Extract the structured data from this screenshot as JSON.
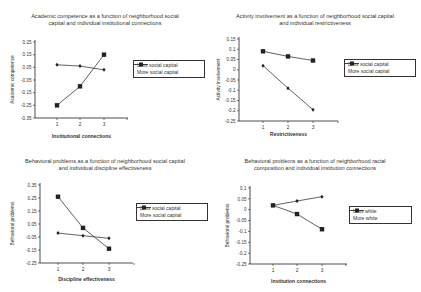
{
  "chart_data": [
    {
      "type": "line",
      "title": "Academic competence as a function of neighborhood social capital and individual institutional connections",
      "title_lines": [
        "Academic competence as a function of neighborhood social",
        "capital and individual institutional connections"
      ],
      "xlabel": "Institutional connections",
      "ylabel": "Academic competence",
      "x": [
        1,
        2,
        3
      ],
      "ylim": [
        -0.35,
        0.25
      ],
      "yticks": [
        0.25,
        0.15,
        0.05,
        -0.05,
        -0.15,
        -0.25,
        -0.35
      ],
      "ytick_labels": [
        "0.25",
        "0.15",
        "0.05",
        "-0.05",
        "-0.15",
        "-0.25",
        "-0.35"
      ],
      "series": [
        {
          "name": "Less social capital",
          "marker": "diamond",
          "values": [
            0.07,
            0.06,
            0.03
          ]
        },
        {
          "name": "More social capital",
          "marker": "square",
          "values": [
            -0.25,
            -0.1,
            0.15
          ]
        }
      ],
      "legend_position": "right",
      "grid": false
    },
    {
      "type": "line",
      "title": "Activity involvement as a function of neighborhood social capital and individual restrictiveness",
      "title_lines": [
        "Activity involvement as a function of neighborhood social capital",
        "and individual restrictiveness"
      ],
      "xlabel": "Restrictiveness",
      "ylabel": "Activity involvement",
      "x": [
        1,
        2,
        3
      ],
      "ylim": [
        -0.25,
        0.15
      ],
      "yticks": [
        0.15,
        0.1,
        0.05,
        0,
        -0.05,
        -0.1,
        -0.15,
        -0.2,
        -0.25
      ],
      "ytick_labels": [
        "0.15",
        "0.1",
        "0.05",
        "0",
        "-0.05",
        "-0.1",
        "-0.15",
        "-0.2",
        "-0.25"
      ],
      "series": [
        {
          "name": "Less social capital",
          "marker": "diamond",
          "values": [
            0.02,
            -0.09,
            -0.195
          ]
        },
        {
          "name": "More social capital",
          "marker": "square",
          "values": [
            0.09,
            0.065,
            0.045
          ]
        }
      ],
      "legend_position": "right",
      "grid": false
    },
    {
      "type": "line",
      "title": "Behavioral problems as a function of neighborhood social capital and individual discipline effectiveness",
      "title_lines": [
        "Behavioral problems as a function of neighborhood social capital",
        "and individual discipline effectiveness"
      ],
      "xlabel": "Discipline effectiveness",
      "ylabel": "Behavioral problems",
      "x": [
        1,
        2,
        3
      ],
      "ylim": [
        -0.25,
        0.35
      ],
      "yticks": [
        0.35,
        0.25,
        0.15,
        0.05,
        -0.05,
        -0.15,
        -0.25
      ],
      "ytick_labels": [
        "0.35",
        "0.25",
        "0.15",
        "0.05",
        "-0.05",
        "-0.15",
        "-0.25"
      ],
      "series": [
        {
          "name": "Less social capital",
          "marker": "diamond",
          "values": [
            -0.02,
            -0.04,
            -0.06
          ]
        },
        {
          "name": "More social capital",
          "marker": "square",
          "values": [
            0.26,
            0.02,
            -0.14
          ]
        }
      ],
      "legend_position": "right",
      "grid": false
    },
    {
      "type": "line",
      "title": "Behavioral problems as a function of neighborhood racial composition and individual institution connections",
      "title_lines": [
        "Behavioral problems as a function of neighborhood racial",
        "composition and individual institution connections"
      ],
      "xlabel": "Institution connections",
      "ylabel": "Behavioral problems",
      "x": [
        1,
        2,
        3
      ],
      "ylim": [
        -0.25,
        0.1
      ],
      "yticks": [
        0.1,
        0.05,
        0,
        -0.05,
        -0.1,
        -0.15,
        -0.2,
        -0.25
      ],
      "ytick_labels": [
        "0.1",
        "0.05",
        "0",
        "-0.05",
        "-0.1",
        "-0.15",
        "-0.2",
        "-0.25"
      ],
      "series": [
        {
          "name": "Less white",
          "marker": "diamond",
          "values": [
            0.02,
            0.04,
            0.06
          ]
        },
        {
          "name": "More white",
          "marker": "square",
          "values": [
            0.02,
            -0.02,
            -0.09
          ]
        }
      ],
      "legend_position": "right",
      "grid": false
    }
  ],
  "layout": {
    "panels": [
      {
        "left": 0,
        "top": 0,
        "title_top": 13,
        "plot": {
          "x0": 35,
          "y0": 42,
          "y1": 118,
          "xticks": [
            57,
            80,
            104
          ],
          "xend": 128
        },
        "legend": {
          "left": 133,
          "top": 60,
          "width": 64
        },
        "xlabel_top": 133,
        "ylabel_cx": 12
      },
      {
        "left": 210,
        "top": 0,
        "title_top": 13,
        "plot": {
          "x0": 29,
          "y0": 39,
          "y1": 121,
          "xticks": [
            53,
            78,
            103
          ],
          "xend": 128
        },
        "legend": {
          "left": 134,
          "top": 59,
          "width": 64
        },
        "xlabel_top": 131,
        "ylabel_cx": 8
      },
      {
        "left": 0,
        "top": 145,
        "title_top": 13,
        "plot": {
          "x0": 40,
          "y0": 40,
          "y1": 118,
          "xticks": [
            58,
            83,
            109
          ],
          "xend": 133
        },
        "legend": {
          "left": 136,
          "top": 58,
          "width": 64
        },
        "xlabel_top": 131,
        "ylabel_cx": 12
      },
      {
        "left": 210,
        "top": 145,
        "title_top": 13,
        "plot": {
          "x0": 40,
          "y0": 43,
          "y1": 119,
          "xticks": [
            63,
            87,
            112
          ],
          "xend": 137
        },
        "legend": {
          "left": 139,
          "top": 61,
          "width": 55
        },
        "xlabel_top": 133,
        "ylabel_cx": 17
      }
    ]
  },
  "colors": {
    "line": "#3a3a3a",
    "axis": "#222222",
    "text": "#333333",
    "background": "#ffffff"
  }
}
